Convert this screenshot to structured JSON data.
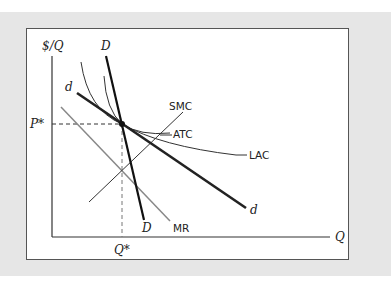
{
  "diagram": {
    "type": "economics-monopolistic-competition-long-run-equilibrium",
    "axes": {
      "y_label": "$/Q",
      "x_label": "Q"
    },
    "equilibrium": {
      "price_label": "P*",
      "quantity_label": "Q*"
    },
    "curves": {
      "D": {
        "label_top": "D",
        "label_bottom": "D"
      },
      "d": {
        "label_top": "d",
        "label_bottom": "d"
      },
      "SMC": {
        "label": "SMC"
      },
      "ATC": {
        "label": "ATC"
      },
      "LAC": {
        "label": "LAC"
      },
      "MR": {
        "label": "MR"
      }
    },
    "colors": {
      "background_band": "#e6e6e6",
      "panel": "#ffffff",
      "lines": "#222222",
      "mr": "#888888"
    }
  }
}
